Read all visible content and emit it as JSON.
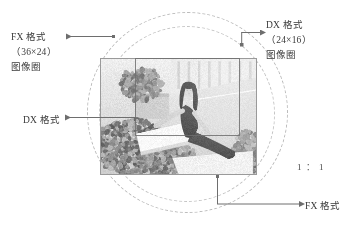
{
  "figure": {
    "background_color": "#ffffff",
    "line_color": "#6e6e6e",
    "dashed_circle_color": "#b9b9b9"
  },
  "labels": {
    "fx_top_left": {
      "line1": "FX 格式",
      "line2": "（36×24）",
      "line3": "图像圈"
    },
    "dx_top_right": {
      "line1": "DX 格式",
      "line2": "（24×16）",
      "line3": "图像圈"
    },
    "dx_left": "DX 格式",
    "fx_bottom_right": "FX 格式",
    "ratio": "1 ： 1"
  },
  "photo": {
    "description": "黑白照片：女子靠坐在户外躺椅上，背景为绿植与道路",
    "alt_text": "grayscale photograph of a woman reclining outdoors"
  },
  "chart_data": {
    "type": "diagram",
    "elements": [
      {
        "name": "FX 图像圈",
        "shape": "dashed-circle",
        "diameter_px": 201,
        "format": "FX",
        "sensor_mm": "36×24"
      },
      {
        "name": "DX 图像圈",
        "shape": "dashed-circle",
        "diameter_px": 176,
        "format": "DX",
        "sensor_mm": "24×16"
      },
      {
        "name": "FX 画幅照片",
        "shape": "rectangle",
        "width_px": 157,
        "height_px": 117,
        "format": "FX"
      },
      {
        "name": "DX 裁切框",
        "shape": "rectangle",
        "width_px": 105,
        "height_px": 78,
        "format": "DX"
      }
    ],
    "annotations": [
      "FX 格式（36×24）图像圈",
      "DX 格式（24×16）图像圈",
      "DX 格式",
      "FX 格式",
      "1 ： 1"
    ]
  }
}
